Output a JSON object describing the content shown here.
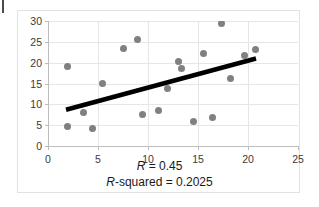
{
  "chart_data": {
    "type": "scatter",
    "title": "",
    "xlabel": "",
    "ylabel": "",
    "xlim": [
      0,
      25
    ],
    "ylim": [
      0,
      30
    ],
    "xticks": [
      0,
      5,
      10,
      15,
      20,
      25
    ],
    "yticks": [
      0,
      5,
      10,
      15,
      20,
      25,
      30
    ],
    "grid": true,
    "legend": "none",
    "point_color": "#808080",
    "trendline_color": "#000000",
    "points": [
      {
        "x": 1.9,
        "y": 19.0
      },
      {
        "x": 1.9,
        "y": 4.8
      },
      {
        "x": 3.5,
        "y": 8.1
      },
      {
        "x": 4.4,
        "y": 4.3
      },
      {
        "x": 5.4,
        "y": 15.0
      },
      {
        "x": 7.5,
        "y": 23.4
      },
      {
        "x": 8.9,
        "y": 25.6
      },
      {
        "x": 9.4,
        "y": 7.5
      },
      {
        "x": 11.0,
        "y": 8.5
      },
      {
        "x": 11.9,
        "y": 13.7
      },
      {
        "x": 13.0,
        "y": 20.3
      },
      {
        "x": 13.3,
        "y": 18.6
      },
      {
        "x": 14.5,
        "y": 5.9
      },
      {
        "x": 15.5,
        "y": 22.3
      },
      {
        "x": 16.4,
        "y": 6.9
      },
      {
        "x": 17.3,
        "y": 29.3
      },
      {
        "x": 18.2,
        "y": 16.1
      },
      {
        "x": 19.6,
        "y": 21.8
      },
      {
        "x": 20.7,
        "y": 23.2
      }
    ],
    "trendline": {
      "x_start": 1.8,
      "y_start": 8.7,
      "x_end": 20.8,
      "y_end": 21.0,
      "slope": 0.647,
      "intercept": 7.54
    },
    "annotations": {
      "r_line": "R = 0.45",
      "r_symbol": "R",
      "r_value": "= 0.45",
      "rsq_symbol": "R",
      "rsq_value": "-squared = 0.2025",
      "rsq_line": "R-squared = 0.2025",
      "r": 0.45,
      "r_squared": 0.2025
    }
  }
}
